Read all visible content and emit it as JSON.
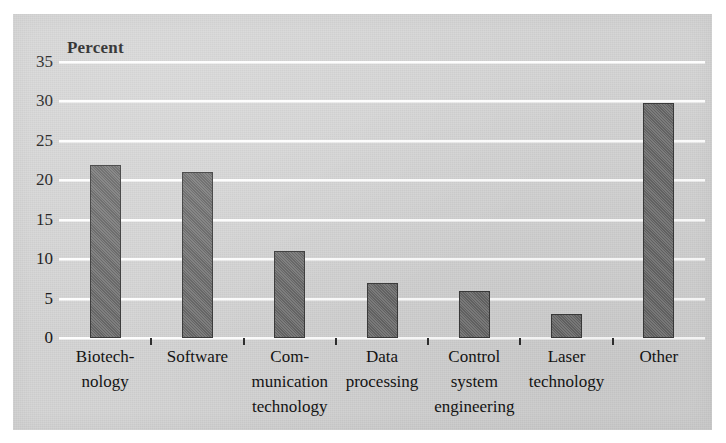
{
  "chart_data": {
    "type": "bar",
    "title": "",
    "ylabel": "Percent",
    "xlabel": "",
    "ylim": [
      0,
      35
    ],
    "ytick_step": 5,
    "yticks": [
      0,
      5,
      10,
      15,
      20,
      25,
      30,
      35
    ],
    "grid": true,
    "legend": false,
    "categories": [
      "Biotech-\nnology",
      "Software",
      "Com-\nmunication\ntechnology",
      "Data\nprocessing",
      "Control\nsystem\nengineering",
      "Laser\ntechnology",
      "Other"
    ],
    "category_lines": [
      [
        "Biotech-",
        "nology"
      ],
      [
        "Software"
      ],
      [
        "Com-",
        "munication",
        "technology"
      ],
      [
        "Data",
        "processing"
      ],
      [
        "Control",
        "system",
        "engineering"
      ],
      [
        "Laser",
        "technology"
      ],
      [
        "Other"
      ]
    ],
    "values": [
      22,
      21,
      11,
      7,
      6,
      3,
      29.8
    ]
  },
  "style": {
    "panel_color": "#d4d4d4",
    "bar_fill": "#6e6e6e",
    "bar_edge": "#3a3a3a",
    "gridline_color": "#fdfdfd",
    "text_color": "#141414"
  }
}
